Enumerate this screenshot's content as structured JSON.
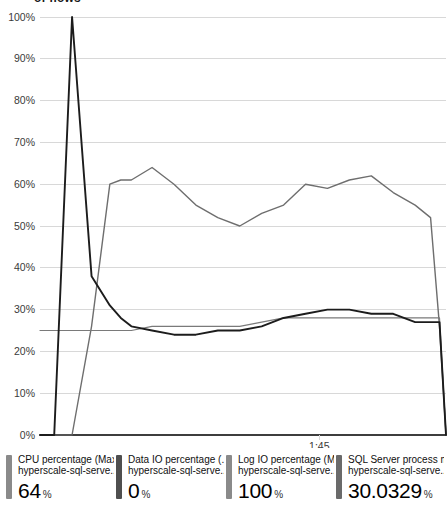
{
  "chart_data": {
    "type": "line",
    "title": "of flows",
    "xlabel": "",
    "ylabel": "",
    "ylim": [
      0,
      100
    ],
    "ytick_labels": [
      "100%",
      "90%",
      "80%",
      "70%",
      "60%",
      "50%",
      "40%",
      "30%",
      "20%",
      "10%",
      "0%"
    ],
    "ytick_values": [
      100,
      90,
      80,
      70,
      60,
      50,
      40,
      30,
      20,
      10,
      0
    ],
    "xtick_labels": [
      "1:45"
    ],
    "xtick_positions": [
      0.688
    ],
    "grid": true,
    "legend_position": "bottom",
    "x": [
      0.0,
      0.035,
      0.079,
      0.127,
      0.172,
      0.199,
      0.225,
      0.276,
      0.33,
      0.384,
      0.438,
      0.492,
      0.546,
      0.6,
      0.654,
      0.708,
      0.762,
      0.816,
      0.87,
      0.924,
      0.962,
      0.984,
      1.0
    ],
    "series": [
      {
        "name": "CPU percentage (Max)",
        "color": "#6e6e6e",
        "width": 1.4,
        "values": [
          0,
          0,
          0,
          26,
          60,
          61,
          61,
          64,
          60,
          55,
          52,
          50,
          53,
          55,
          60,
          59,
          61,
          62,
          58,
          55,
          52,
          26,
          0
        ]
      },
      {
        "name": "Data IO percentage (...",
        "color": "#4a4a4a",
        "width": 1.1,
        "values": [
          0,
          0,
          0,
          0,
          0,
          0,
          0,
          0,
          0,
          0,
          0,
          0,
          0,
          0,
          0,
          0,
          0,
          0,
          0,
          0,
          0,
          0,
          0
        ]
      },
      {
        "name": "Log IO percentage (Max)",
        "color": "#7a7a7a",
        "width": 1.2,
        "values": [
          25,
          25,
          25,
          25,
          25,
          25,
          25,
          26,
          26,
          26,
          26,
          26,
          27,
          28,
          28,
          28,
          28,
          28,
          28,
          28,
          28,
          28,
          0
        ]
      },
      {
        "name": "SQL Server process m...",
        "color": "#1c1c1c",
        "width": 1.9,
        "values": [
          0,
          0,
          100,
          38,
          31,
          28,
          26,
          25,
          24,
          24,
          25,
          25,
          26,
          28,
          29,
          30,
          30,
          29,
          29,
          27,
          27,
          27,
          0
        ]
      }
    ]
  },
  "legend": {
    "items": [
      {
        "metric": "CPU percentage (Max)",
        "resource": "hyperscale-sql-serve..",
        "value": "64",
        "unit": "%",
        "color": "#8a8a8a"
      },
      {
        "metric": "Data IO percentage (...",
        "resource": "hyperscale-sql-serve..",
        "value": "0",
        "unit": "%",
        "color": "#4f4f4f"
      },
      {
        "metric": "Log IO percentage (Max)",
        "resource": "hyperscale-sql-serve..",
        "value": "100",
        "unit": "%",
        "color": "#8a8a8a"
      },
      {
        "metric": "SQL Server process m...",
        "resource": "hyperscale-sql-serve..",
        "value": "30.0329",
        "unit": "%",
        "color": "#6a6a6a"
      }
    ]
  },
  "axes": {
    "grid_color": "#d8d8d8",
    "axis_color": "#333333",
    "label_color": "#3a3a3a"
  }
}
